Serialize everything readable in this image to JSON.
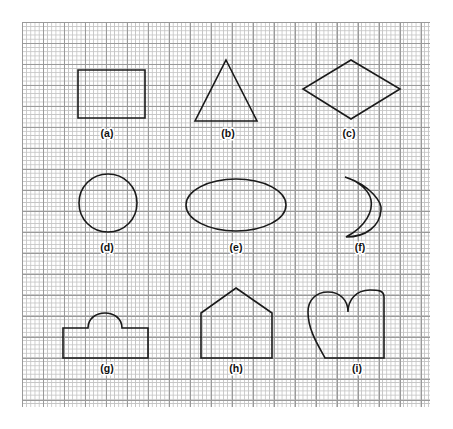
{
  "figure": {
    "background_color": "#ffffff",
    "stroke_color": "#1a1a1a",
    "grid": {
      "minor_color": "#c4c4c4",
      "major_color": "#9a9a9a",
      "minor_spacing_px": 4.2,
      "major_spacing_px": 21,
      "left": 22,
      "top": 22,
      "width": 408,
      "height": 385
    },
    "rows": 3,
    "columns": 3,
    "shapes": [
      {
        "key": "a",
        "label": "(a)",
        "name": "square",
        "label_x": 107,
        "label_y": 137,
        "path": "M 78 70 L 145 70 L 145 118 L 78 118 Z"
      },
      {
        "key": "b",
        "label": "(b)",
        "name": "triangle",
        "label_x": 228,
        "label_y": 137,
        "path": "M 226 60 L 257 121 L 195 121 Z"
      },
      {
        "key": "c",
        "label": "(c)",
        "name": "diamond",
        "label_x": 349,
        "label_y": 137,
        "path": "M 351 60 L 400 89 L 351 119 L 303 89 Z"
      },
      {
        "key": "d",
        "label": "(d)",
        "name": "circle",
        "label_x": 107,
        "label_y": 251,
        "path": "M 108 174 C 124.5 174 137 187 137 203 C 137 219 124.5 232 108 232 C 91.5 232 79 219 79 203 C 79 187 91.5 174 108 174 Z"
      },
      {
        "key": "e",
        "label": "(e)",
        "name": "ellipse",
        "label_x": 236,
        "label_y": 251,
        "path": "M 236 179 C 263.6 179 286 190.6 286 205 C 286 219.4 263.6 231 236 231 C 208.4 231 186 219.4 186 205 C 186 190.6 208.4 179 236 179 Z"
      },
      {
        "key": "f",
        "label": "(f)",
        "name": "crescent",
        "label_x": 360,
        "label_y": 251,
        "path": "M 345 177 C 372 186 382 203 381 210 C 380 226 366 237 346 237 C 367 226 373 210 371 200 C 369 190 358 181 345 177 Z"
      },
      {
        "key": "g",
        "label": "(g)",
        "name": "rectangle-with-dome",
        "label_x": 107,
        "label_y": 372,
        "path": "M 63 358 L 63 328 L 88 328 C 88 308 122 308 122 328 L 148 328 L 148 358 Z"
      },
      {
        "key": "h",
        "label": "(h)",
        "name": "house-pentagon",
        "label_x": 236,
        "label_y": 372,
        "path": "M 236 288 L 272 313 L 272 358 L 201 358 L 201 313 Z"
      },
      {
        "key": "i",
        "label": "(i)",
        "name": "heart",
        "label_x": 357,
        "label_y": 372,
        "path": "M 384 358 L 384 297 C 384 290 377 290 370 290 C 356 290 348 300 348 312 C 348 300 340 292 328 292 C 316 292 308 300 308 312 C 308 330 318 345 325 358 Z"
      }
    ]
  }
}
